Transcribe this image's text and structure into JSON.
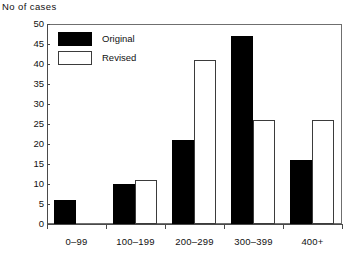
{
  "chart_data": {
    "type": "bar",
    "title": "",
    "ylabel": "No of cases",
    "xlabel": "",
    "categories": [
      "0–99",
      "100–199",
      "200–299",
      "300–399",
      "400+"
    ],
    "series": [
      {
        "name": "Original",
        "values": [
          6,
          10,
          21,
          47,
          16
        ],
        "color": "#000000"
      },
      {
        "name": "Revised",
        "values": [
          0,
          11,
          41,
          26,
          26
        ],
        "color": "#ffffff"
      }
    ],
    "ylim": [
      0,
      50
    ],
    "yticks": [
      0,
      5,
      10,
      15,
      20,
      25,
      30,
      35,
      40,
      45,
      50
    ],
    "ytick_labels": [
      "0",
      "5",
      "10",
      "15",
      "20",
      "25",
      "30",
      "35",
      "40",
      "45",
      "50"
    ],
    "grid": false,
    "legend": {
      "position": "top-left",
      "entries": [
        "Original",
        "Revised"
      ]
    }
  }
}
